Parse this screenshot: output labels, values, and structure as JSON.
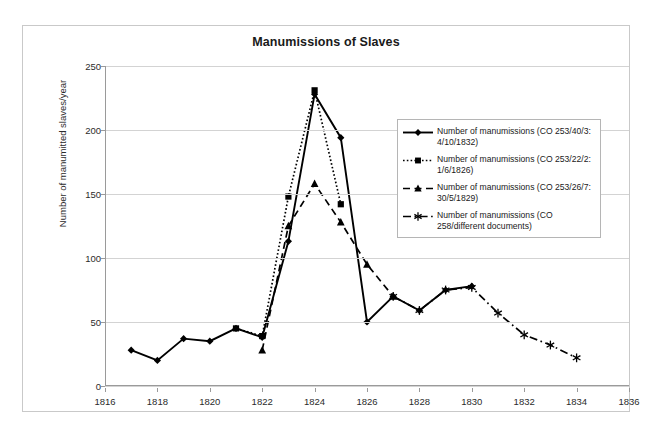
{
  "chart_data": {
    "type": "line",
    "title": "Manumissions of Slaves",
    "xlabel": "",
    "ylabel": "Number of manumitted slaves/year",
    "xlim": [
      1816,
      1836
    ],
    "ylim": [
      0,
      250
    ],
    "xticks": [
      1816,
      1818,
      1820,
      1822,
      1824,
      1826,
      1828,
      1830,
      1832,
      1834,
      1836
    ],
    "yticks": [
      0,
      50,
      100,
      150,
      200,
      250
    ],
    "grid": "horizontal",
    "legend_position": "center-right",
    "series": [
      {
        "name": "Number of manumissions (CO 253/40/3: 4/10/1832)",
        "marker": "diamond",
        "line_style": "solid",
        "color": "#000000",
        "x": [
          1817,
          1818,
          1819,
          1820,
          1821,
          1822,
          1823,
          1824,
          1825,
          1826,
          1827,
          1828,
          1829,
          1830
        ],
        "values": [
          28,
          20,
          37,
          35,
          45,
          38,
          113,
          228,
          194,
          50,
          70,
          59,
          75,
          78
        ]
      },
      {
        "name": "Number of manumissions (CO 253/22/2: 1/6/1826)",
        "marker": "square",
        "line_style": "dotted",
        "color": "#000000",
        "x": [
          1821,
          1822,
          1823,
          1824,
          1825
        ],
        "values": [
          45,
          39,
          148,
          231,
          142
        ]
      },
      {
        "name": "Number of manumissions (CO 253/26/7: 30/5/1829)",
        "marker": "triangle",
        "line_style": "dashed",
        "color": "#000000",
        "x": [
          1822,
          1823,
          1824,
          1825,
          1826,
          1827
        ],
        "values": [
          28,
          125,
          158,
          128,
          95,
          70
        ]
      },
      {
        "name": "Number of manumissions (CO 258/different documents)",
        "marker": "asterisk",
        "line_style": "dash-dot",
        "color": "#000000",
        "x": [
          1827,
          1828,
          1829,
          1830,
          1831,
          1832,
          1833,
          1834
        ],
        "values": [
          70,
          59,
          75,
          77,
          57,
          40,
          32,
          22
        ]
      }
    ]
  },
  "legend": {
    "items": [
      {
        "label": "Number of manumissions (CO 253/40/3: 4/10/1832)",
        "marker": "diamond",
        "line_style": "solid"
      },
      {
        "label": "Number of manumissions (CO 253/22/2: 1/6/1826)",
        "marker": "square",
        "line_style": "dotted"
      },
      {
        "label": "Number of manumissions (CO 253/26/7: 30/5/1829)",
        "marker": "triangle",
        "line_style": "dashed"
      },
      {
        "label": "Number of manumissions (CO 258/different documents)",
        "marker": "asterisk",
        "line_style": "dash-dot"
      }
    ]
  },
  "colors": {
    "series": "#000000",
    "gridline": "#d3d3d3",
    "axis": "#9a9a9a",
    "frame": "#c9c9c9",
    "background": "#ffffff"
  }
}
